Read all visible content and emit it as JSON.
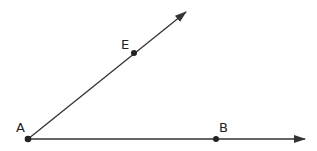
{
  "diagram": {
    "type": "angle",
    "points": [
      {
        "label": "A",
        "x": 28,
        "y": 139,
        "role": "vertex"
      },
      {
        "label": "E",
        "x": 134,
        "y": 53,
        "role": "point-on-ray"
      },
      {
        "label": "B",
        "x": 216,
        "y": 139,
        "role": "point-on-ray"
      }
    ],
    "rays": [
      {
        "name": "ray-AE",
        "from": "A",
        "through": "E"
      },
      {
        "name": "ray-AB",
        "from": "A",
        "through": "B"
      }
    ],
    "labels": {
      "a": "A",
      "e": "E",
      "b": "B"
    },
    "colors": {
      "line": "#333333",
      "point": "#222222"
    }
  }
}
